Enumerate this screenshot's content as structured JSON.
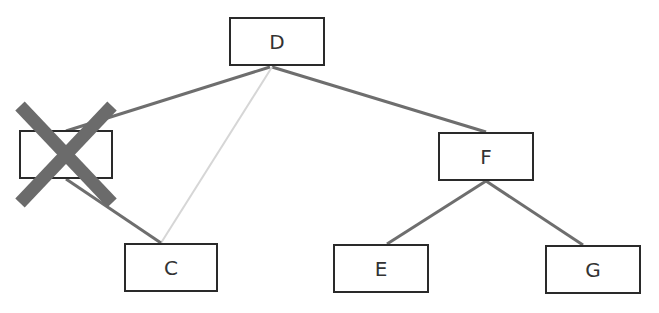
{
  "diagram": {
    "type": "tree",
    "nodes": [
      {
        "id": "D",
        "label": "D",
        "x": 229,
        "y": 17,
        "w": 96,
        "h": 49
      },
      {
        "id": "B",
        "label": "",
        "x": 19,
        "y": 130,
        "w": 94,
        "h": 49,
        "crossed_out": true
      },
      {
        "id": "C",
        "label": "C",
        "x": 124,
        "y": 243,
        "w": 94,
        "h": 49
      },
      {
        "id": "F",
        "label": "F",
        "x": 438,
        "y": 132,
        "w": 96,
        "h": 49
      },
      {
        "id": "E",
        "label": "E",
        "x": 333,
        "y": 244,
        "w": 96,
        "h": 49
      },
      {
        "id": "G",
        "label": "G",
        "x": 545,
        "y": 245,
        "w": 96,
        "h": 49
      }
    ],
    "edges": [
      {
        "from": "D",
        "to": "B",
        "style": "solid",
        "color": "#6e6e6e"
      },
      {
        "from": "D",
        "to": "F",
        "style": "solid",
        "color": "#6e6e6e"
      },
      {
        "from": "D",
        "to": "C",
        "style": "new",
        "color": "#d6d6d6"
      },
      {
        "from": "B",
        "to": "C",
        "style": "solid",
        "color": "#6e6e6e"
      },
      {
        "from": "F",
        "to": "E",
        "style": "solid",
        "color": "#6e6e6e"
      },
      {
        "from": "F",
        "to": "G",
        "style": "solid",
        "color": "#6e6e6e"
      }
    ],
    "cross_mark": {
      "on": "B",
      "color": "#6b6b6b"
    }
  }
}
